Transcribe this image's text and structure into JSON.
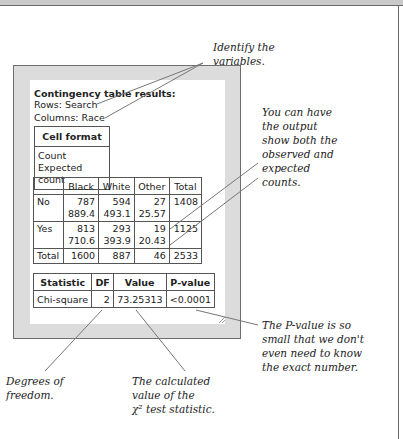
{
  "annotations": {
    "variables": [
      "Identify the",
      "variables."
    ],
    "counts": [
      "You can have",
      "the output",
      "show both the",
      "observed and",
      "expected",
      "counts."
    ],
    "pvalue": [
      "The P-value is so",
      "small that we don't",
      "even need to know",
      "the exact number."
    ],
    "df": [
      "Degrees of",
      "freedom."
    ],
    "value": [
      "The calculated",
      "value of the",
      "χ² test statistic."
    ]
  },
  "output": {
    "title": "Contingency table results:",
    "rows_label": "Rows: Search",
    "columns_label": "Columns: Race",
    "cell_format": {
      "header": "Cell format",
      "lines": [
        "Count",
        "Expected count"
      ]
    },
    "contingency": {
      "headers": [
        "",
        "Black",
        "White",
        "Other",
        "Total"
      ],
      "rows": [
        {
          "label": "No",
          "observed": [
            "787",
            "594",
            "27"
          ],
          "expected": [
            "889.4",
            "493.1",
            "25.57"
          ],
          "total": "1408"
        },
        {
          "label": "Yes",
          "observed": [
            "813",
            "293",
            "19"
          ],
          "expected": [
            "710.6",
            "393.9",
            "20.43"
          ],
          "total": "1125"
        }
      ],
      "totals": {
        "label": "Total",
        "values": [
          "1600",
          "887",
          "46",
          "2533"
        ]
      }
    },
    "statistics": {
      "headers": [
        "Statistic",
        "DF",
        "Value",
        "P-value"
      ],
      "rows": [
        {
          "statistic": "Chi-square",
          "df": "2",
          "value": "73.25313",
          "pvalue": "<0.0001"
        }
      ]
    }
  },
  "colors": {
    "panel": "#dcdcdc",
    "border": "#555555",
    "line": "#777777"
  }
}
